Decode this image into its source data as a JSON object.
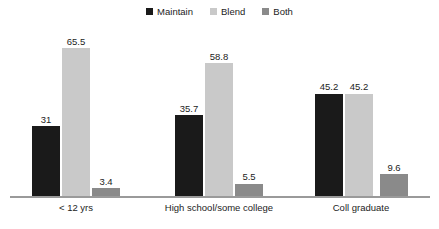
{
  "chart_data": {
    "type": "bar",
    "title": "",
    "subtitle": "",
    "xlabel": "",
    "ylabel": "",
    "ylim": [
      0,
      70
    ],
    "grid": false,
    "legend_position": "top-center",
    "categories": [
      "< 12 yrs",
      "High school/some college",
      "Coll graduate"
    ],
    "series": [
      {
        "name": "Maintain",
        "color": "#1a1a1a",
        "values": [
          31,
          35.7,
          45.2
        ],
        "value_labels": [
          "31",
          "35.7",
          "45.2"
        ]
      },
      {
        "name": "Blend",
        "color": "#c9c9c9",
        "values": [
          65.5,
          58.8,
          45.2
        ],
        "value_labels": [
          "65.5",
          "58.8",
          "45.2"
        ]
      },
      {
        "name": "Both",
        "color": "#8a8a8a",
        "values": [
          3.4,
          5.5,
          9.6
        ],
        "value_labels": [
          "3.4",
          "5.5",
          "9.6"
        ]
      }
    ],
    "axis_color": "#9a9a9a",
    "text_color": "#1c1c1c"
  },
  "legend": {
    "items": [
      {
        "label": "Maintain",
        "swatch_color": "#1a1a1a",
        "icon": "square-marker-icon"
      },
      {
        "label": "Blend",
        "swatch_color": "#c9c9c9",
        "icon": "square-marker-icon"
      },
      {
        "label": "Both",
        "swatch_color": "#8a8a8a",
        "icon": "square-marker-icon"
      }
    ]
  }
}
